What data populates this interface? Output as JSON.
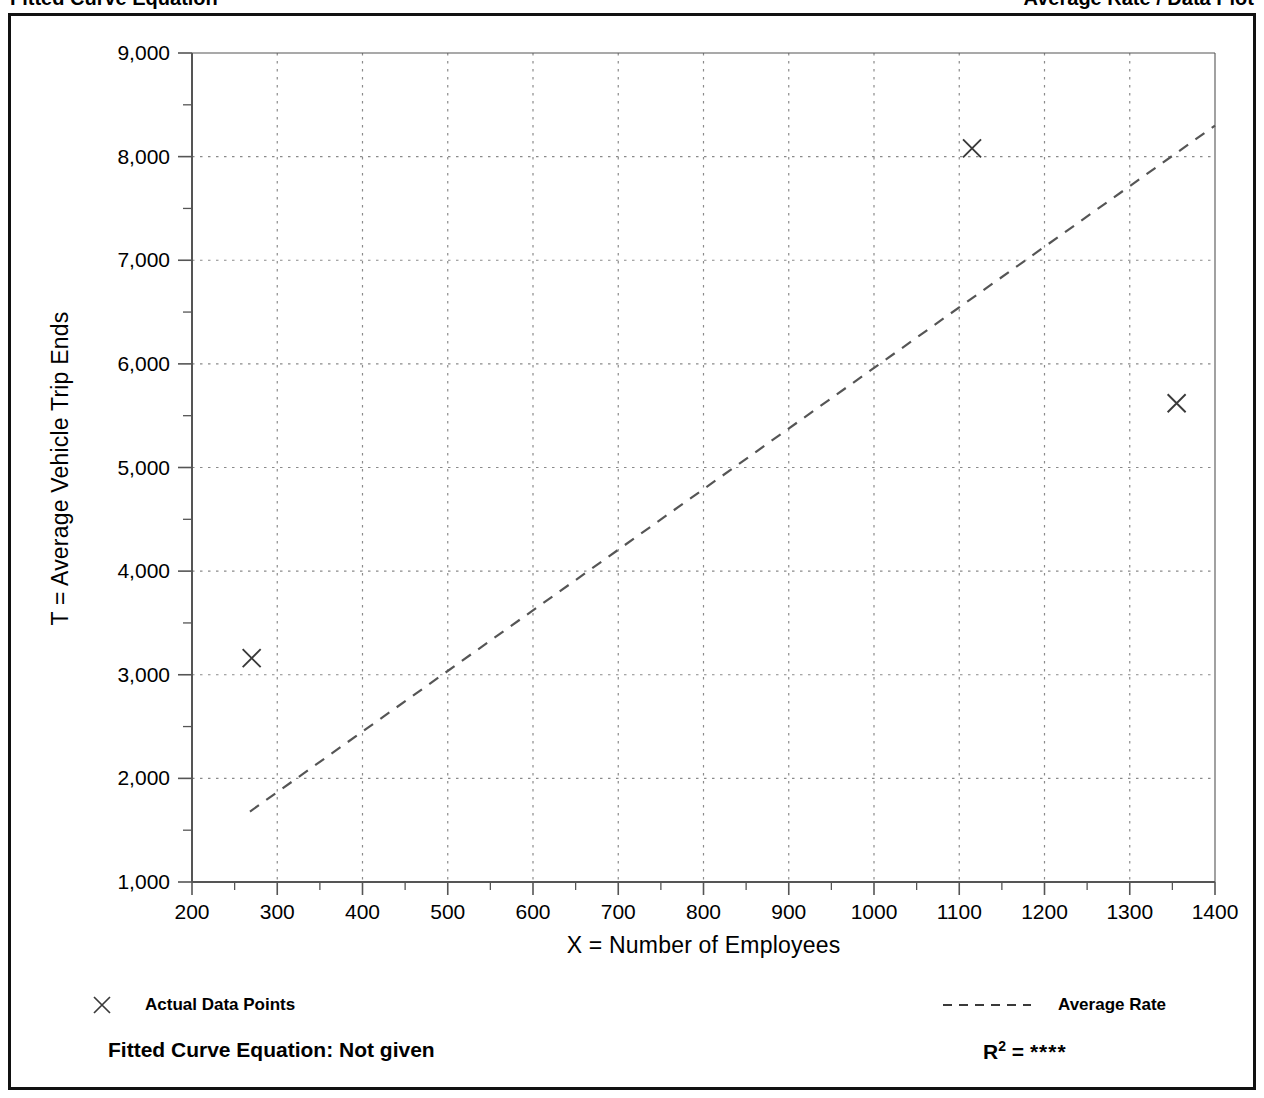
{
  "header": {
    "left_text_cropped": "Fitted Curve Equation",
    "right_text_cropped": "Average Rate / Data Plot"
  },
  "axes": {
    "x_title": "X = Number of Employees",
    "y_title": "T = Average Vehicle Trip Ends",
    "x_ticks": [
      "200",
      "300",
      "400",
      "500",
      "600",
      "700",
      "800",
      "900",
      "1000",
      "1100",
      "1200",
      "1300",
      "1400"
    ],
    "y_ticks": [
      "1,000",
      "2,000",
      "3,000",
      "4,000",
      "5,000",
      "6,000",
      "7,000",
      "8,000",
      "9,000"
    ]
  },
  "legend": {
    "data_points_label": "Actual Data Points",
    "average_rate_label": "Average Rate"
  },
  "footer": {
    "equation_label": "Fitted Curve Equation:  Not given",
    "r_squared_label": "R",
    "r_squared_exponent": "2",
    "r_squared_equals": " = ",
    "r_squared_value": "****"
  },
  "colors": {
    "frame": "#111111",
    "axis": "#555555",
    "grid": "#8a8a8a",
    "marker": "#3a3a3a",
    "trend": "#555555",
    "background": "#ffffff"
  },
  "chart_data": {
    "type": "scatter",
    "title": "",
    "xlabel": "X = Number of Employees",
    "ylabel": "T = Average Vehicle Trip Ends",
    "xlim": [
      200,
      1400
    ],
    "ylim": [
      1000,
      9000
    ],
    "xticks": [
      200,
      300,
      400,
      500,
      600,
      700,
      800,
      900,
      1000,
      1100,
      1200,
      1300,
      1400
    ],
    "yticks": [
      1000,
      2000,
      3000,
      4000,
      5000,
      6000,
      7000,
      8000,
      9000
    ],
    "x_minor_tick_interval": 50,
    "y_minor_tick_interval": 500,
    "grid": true,
    "grid_style": "dotted",
    "legend_position": "below-plot",
    "series": [
      {
        "name": "Actual Data Points",
        "type": "scatter",
        "marker": "x",
        "points": [
          {
            "x": 270,
            "y": 3160
          },
          {
            "x": 1115,
            "y": 8080
          },
          {
            "x": 1355,
            "y": 5620
          }
        ]
      },
      {
        "name": "Average Rate",
        "type": "line",
        "style": "dashed",
        "points": [
          {
            "x": 268,
            "y": 1680
          },
          {
            "x": 1400,
            "y": 8300
          }
        ]
      }
    ],
    "annotations": [
      "Fitted Curve Equation:  Not given",
      "R² = ****"
    ]
  }
}
